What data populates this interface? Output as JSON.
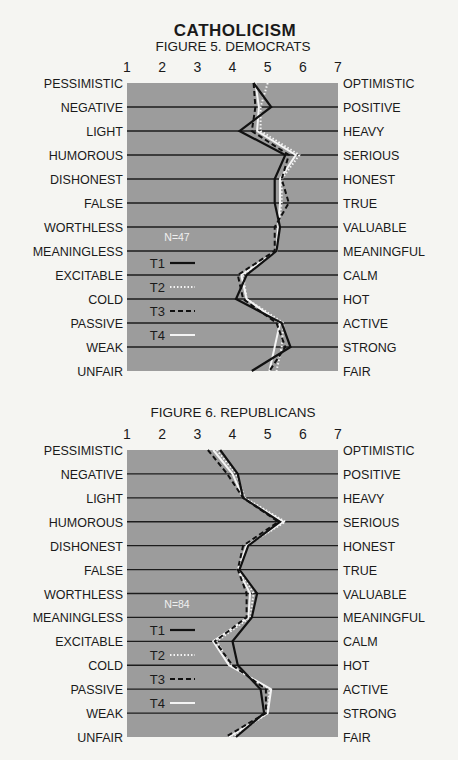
{
  "title": "CATHOLICISM",
  "colors": {
    "page_bg": "#f5f5f2",
    "plot_bg": "#9c9c9c",
    "grid": "#1c1c1c",
    "text": "#1a1a1a",
    "T1": "#111111",
    "T2": "#f4f4f4",
    "T3": "#111111",
    "T4": "#f4f4f4"
  },
  "chart_data": [
    {
      "type": "line",
      "title": "FIGURE 5. DEMOCRATS",
      "orientation": "horizontal-profile",
      "x_ticks": [
        "1",
        "2",
        "3",
        "4",
        "5",
        "6",
        "7"
      ],
      "xlim": [
        1,
        7
      ],
      "left_labels": [
        "PESSIMISTIC",
        "NEGATIVE",
        "LIGHT",
        "HUMOROUS",
        "DISHONEST",
        "FALSE",
        "WORTHLESS",
        "MEANINGLESS",
        "EXCITABLE",
        "COLD",
        "PASSIVE",
        "WEAK",
        "UNFAIR"
      ],
      "right_labels": [
        "OPTIMISTIC",
        "POSITIVE",
        "HEAVY",
        "SERIOUS",
        "HONEST",
        "TRUE",
        "VALUABLE",
        "MEANINGFUL",
        "CALM",
        "HOT",
        "ACTIVE",
        "STRONG",
        "FAIR"
      ],
      "annotation": "N=47",
      "legend": [
        "T1",
        "T2",
        "T3",
        "T4"
      ],
      "series": [
        {
          "name": "T1",
          "style": "solid-black",
          "values": [
            4.6,
            5.1,
            4.2,
            5.5,
            5.2,
            5.2,
            5.35,
            5.25,
            4.4,
            4.1,
            5.4,
            5.65,
            4.55
          ]
        },
        {
          "name": "T2",
          "style": "dotted-white",
          "values": [
            5.0,
            4.8,
            4.8,
            5.9,
            5.4,
            5.4,
            5.3,
            5.25,
            4.3,
            4.4,
            5.45,
            5.4,
            5.25
          ]
        },
        {
          "name": "T3",
          "style": "dashed-black",
          "values": [
            4.6,
            4.65,
            4.55,
            5.6,
            5.4,
            5.6,
            5.2,
            5.2,
            4.15,
            4.3,
            5.25,
            5.5,
            5.05
          ]
        },
        {
          "name": "T4",
          "style": "solid-white",
          "values": [
            4.65,
            4.75,
            4.7,
            5.8,
            5.35,
            5.35,
            5.3,
            5.25,
            4.25,
            4.4,
            5.35,
            5.2,
            5.05
          ]
        }
      ]
    },
    {
      "type": "line",
      "title": "FIGURE 6. REPUBLICANS",
      "orientation": "horizontal-profile",
      "x_ticks": [
        "1",
        "2",
        "3",
        "4",
        "5",
        "6",
        "7"
      ],
      "xlim": [
        1,
        7
      ],
      "left_labels": [
        "PESSIMISTIC",
        "NEGATIVE",
        "LIGHT",
        "HUMOROUS",
        "DISHONEST",
        "FALSE",
        "WORTHLESS",
        "MEANINGLESS",
        "EXCITABLE",
        "COLD",
        "PASSIVE",
        "WEAK",
        "UNFAIR"
      ],
      "right_labels": [
        "OPTIMISTIC",
        "POSITIVE",
        "HEAVY",
        "SERIOUS",
        "HONEST",
        "TRUE",
        "VALUABLE",
        "MEANINGFUL",
        "CALM",
        "HOT",
        "ACTIVE",
        "STRONG",
        "FAIR"
      ],
      "annotation": "N=84",
      "legend": [
        "T1",
        "T2",
        "T3",
        "T4"
      ],
      "series": [
        {
          "name": "T1",
          "style": "solid-black",
          "values": [
            3.65,
            4.15,
            4.3,
            5.35,
            4.45,
            4.2,
            4.7,
            4.55,
            4.0,
            4.15,
            4.8,
            4.9,
            4.1
          ]
        },
        {
          "name": "T2",
          "style": "dotted-white",
          "values": [
            3.55,
            4.1,
            4.35,
            5.5,
            4.4,
            4.2,
            4.6,
            4.5,
            3.55,
            3.95,
            5.05,
            5.0,
            4.0
          ]
        },
        {
          "name": "T3",
          "style": "dashed-black",
          "values": [
            3.3,
            3.85,
            4.3,
            5.3,
            4.3,
            4.15,
            4.4,
            4.4,
            3.5,
            4.0,
            4.95,
            4.95,
            3.8
          ]
        },
        {
          "name": "T4",
          "style": "solid-white",
          "values": [
            3.45,
            4.0,
            4.3,
            5.45,
            4.4,
            4.15,
            4.5,
            4.45,
            3.45,
            3.9,
            5.1,
            5.0,
            3.9
          ]
        }
      ]
    }
  ]
}
